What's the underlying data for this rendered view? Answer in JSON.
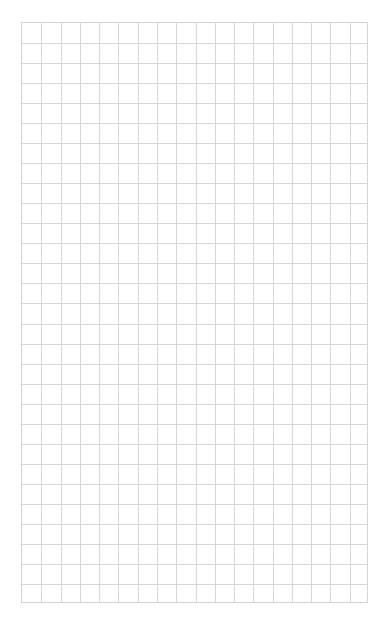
{
  "page": {
    "background": "#ffffff",
    "line_color": "#d6d6d6"
  },
  "grid": {
    "left": 21,
    "top": 22,
    "width": 347,
    "height": 581,
    "columns": 18,
    "rows": 29
  }
}
